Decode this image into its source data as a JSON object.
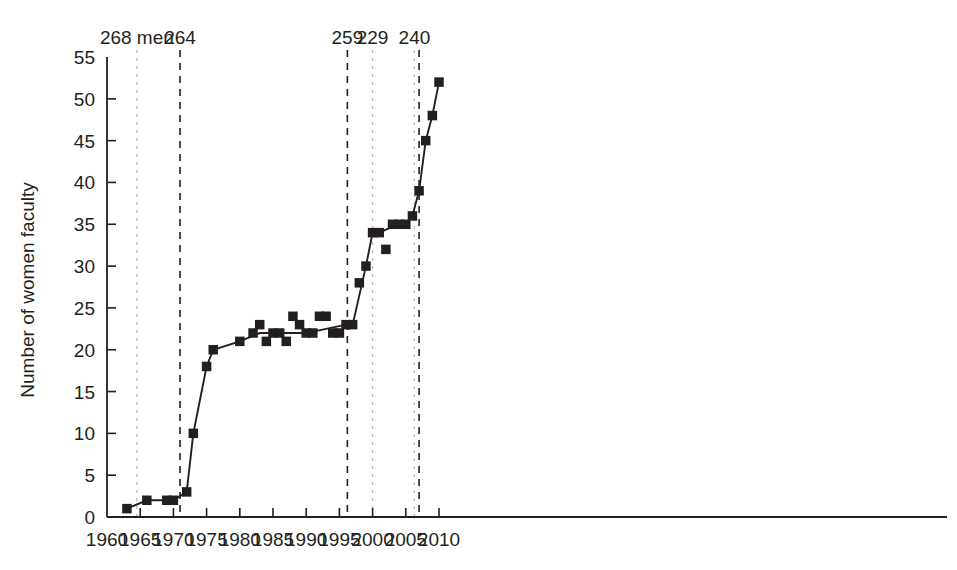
{
  "chart_data": {
    "type": "line",
    "title": "",
    "subtitle": "",
    "xlabel": "",
    "ylabel": "Number of women faculty",
    "xlim": [
      1960,
      2011.5
    ],
    "ylim": [
      0,
      55
    ],
    "grid": false,
    "legend": "none",
    "marker": "square",
    "series_color": "#231f20",
    "xticks": [
      1960,
      1965,
      1970,
      1975,
      1980,
      1985,
      1990,
      1995,
      2000,
      2005,
      2010
    ],
    "xtick_labels": [
      "1960",
      "1965",
      "1970",
      "1975",
      "1980",
      "1985",
      "1990",
      "1995",
      "2000",
      "2005",
      "2010"
    ],
    "yticks": [
      0,
      5,
      10,
      15,
      20,
      25,
      30,
      35,
      40,
      45,
      50,
      55
    ],
    "ytick_labels": [
      "0",
      "5",
      "10",
      "15",
      "20",
      "25",
      "30",
      "35",
      "40",
      "45",
      "50",
      "55"
    ],
    "series": [
      {
        "name": "Number of women faculty",
        "points": [
          {
            "x": 1963,
            "y": 1
          },
          {
            "x": 1966,
            "y": 2
          },
          {
            "x": 1969,
            "y": 2
          },
          {
            "x": 1970,
            "y": 2
          },
          {
            "x": 1972,
            "y": 3
          },
          {
            "x": 1973,
            "y": 10
          },
          {
            "x": 1975,
            "y": 18
          },
          {
            "x": 1976,
            "y": 20
          },
          {
            "x": 1980,
            "y": 21
          },
          {
            "x": 1982,
            "y": 22
          },
          {
            "x": 1983,
            "y": 23
          },
          {
            "x": 1984,
            "y": 21
          },
          {
            "x": 1985,
            "y": 22
          },
          {
            "x": 1986,
            "y": 22
          },
          {
            "x": 1987,
            "y": 21
          },
          {
            "x": 1988,
            "y": 24
          },
          {
            "x": 1989,
            "y": 23
          },
          {
            "x": 1990,
            "y": 22
          },
          {
            "x": 1991,
            "y": 22
          },
          {
            "x": 1992,
            "y": 24
          },
          {
            "x": 1993,
            "y": 24
          },
          {
            "x": 1994,
            "y": 22
          },
          {
            "x": 1995,
            "y": 22
          },
          {
            "x": 1996,
            "y": 23
          },
          {
            "x": 1997,
            "y": 23
          },
          {
            "x": 1998,
            "y": 28
          },
          {
            "x": 1999,
            "y": 30
          },
          {
            "x": 2000,
            "y": 34
          },
          {
            "x": 2001,
            "y": 34
          },
          {
            "x": 2002,
            "y": 32
          },
          {
            "x": 2003,
            "y": 35
          },
          {
            "x": 2004,
            "y": 35
          },
          {
            "x": 2005,
            "y": 35
          },
          {
            "x": 2006,
            "y": 36
          },
          {
            "x": 2007,
            "y": 39
          },
          {
            "x": 2008,
            "y": 45
          },
          {
            "x": 2009,
            "y": 48
          },
          {
            "x": 2010,
            "y": 52
          }
        ],
        "line_path": [
          {
            "x": 1963,
            "y": 1
          },
          {
            "x": 1966,
            "y": 2
          },
          {
            "x": 1969,
            "y": 2
          },
          {
            "x": 1970,
            "y": 2
          },
          {
            "x": 1972,
            "y": 3
          },
          {
            "x": 1973,
            "y": 10
          },
          {
            "x": 1975,
            "y": 18
          },
          {
            "x": 1976,
            "y": 20
          },
          {
            "x": 1980,
            "y": 21
          },
          {
            "x": 1983,
            "y": 22
          },
          {
            "x": 1986,
            "y": 22
          },
          {
            "x": 1990,
            "y": 22
          },
          {
            "x": 1993,
            "y": 22.5
          },
          {
            "x": 1996,
            "y": 23
          },
          {
            "x": 1997,
            "y": 23
          },
          {
            "x": 1999,
            "y": 30
          },
          {
            "x": 2000,
            "y": 34
          },
          {
            "x": 2001,
            "y": 34
          },
          {
            "x": 2003,
            "y": 34.7
          },
          {
            "x": 2005,
            "y": 35
          },
          {
            "x": 2006,
            "y": 36
          },
          {
            "x": 2007,
            "y": 39
          },
          {
            "x": 2008,
            "y": 45
          },
          {
            "x": 2009,
            "y": 48
          },
          {
            "x": 2010,
            "y": 52
          }
        ]
      }
    ],
    "annotations": [
      {
        "label": "268 men",
        "x": 1964.5,
        "style": "light-dashed"
      },
      {
        "label": "264",
        "x": 1971.0,
        "style": "dark-dashed"
      },
      {
        "label": "259",
        "x": 1996.2,
        "style": "dark-dashed"
      },
      {
        "label": "229",
        "x": 2000.0,
        "style": "light-dashed"
      },
      {
        "label": "240",
        "x": 2006.3,
        "style": "light-dashed"
      },
      {
        "label": "",
        "x": 2007.0,
        "style": "dark-dashed"
      }
    ],
    "colors": {
      "axis": "#231f20",
      "data": "#231f20",
      "light_dash": "#b9b9b9",
      "dark_dash": "#231f20"
    }
  }
}
